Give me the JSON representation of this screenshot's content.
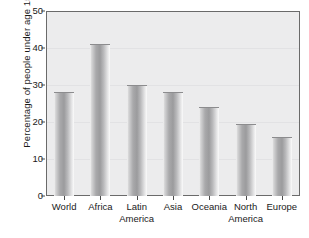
{
  "chart_data": {
    "type": "bar",
    "title": "",
    "subtitle": "",
    "xlabel": "",
    "ylabel": "Percentage of people under age 15",
    "categories": [
      "World",
      "Africa",
      "Latin America",
      "Asia",
      "Oceania",
      "North America",
      "Europe"
    ],
    "category_lines": [
      [
        "World",
        ""
      ],
      [
        "Africa",
        ""
      ],
      [
        "Latin",
        "America"
      ],
      [
        "Asia",
        ""
      ],
      [
        "Oceania",
        ""
      ],
      [
        "North",
        "America"
      ],
      [
        "Europe",
        ""
      ]
    ],
    "values": [
      28,
      41,
      30,
      28,
      24,
      19.5,
      16
    ],
    "ylim": [
      0,
      50
    ],
    "yticks": [
      0,
      10,
      20,
      30,
      40,
      50
    ],
    "ytick_labels": [
      "0",
      "10",
      "20",
      "30",
      "40",
      "50"
    ],
    "grid": true,
    "legend": "none",
    "colors": {
      "bar_fill_light": "#f4f4f4",
      "bar_fill_dark": "#9b9b9d",
      "plot_background": "#ececed",
      "axis": "#6a6a6a",
      "gridline": "#e2e2e4",
      "text": "#1a1a1a",
      "page_background": "#ffffff"
    }
  }
}
